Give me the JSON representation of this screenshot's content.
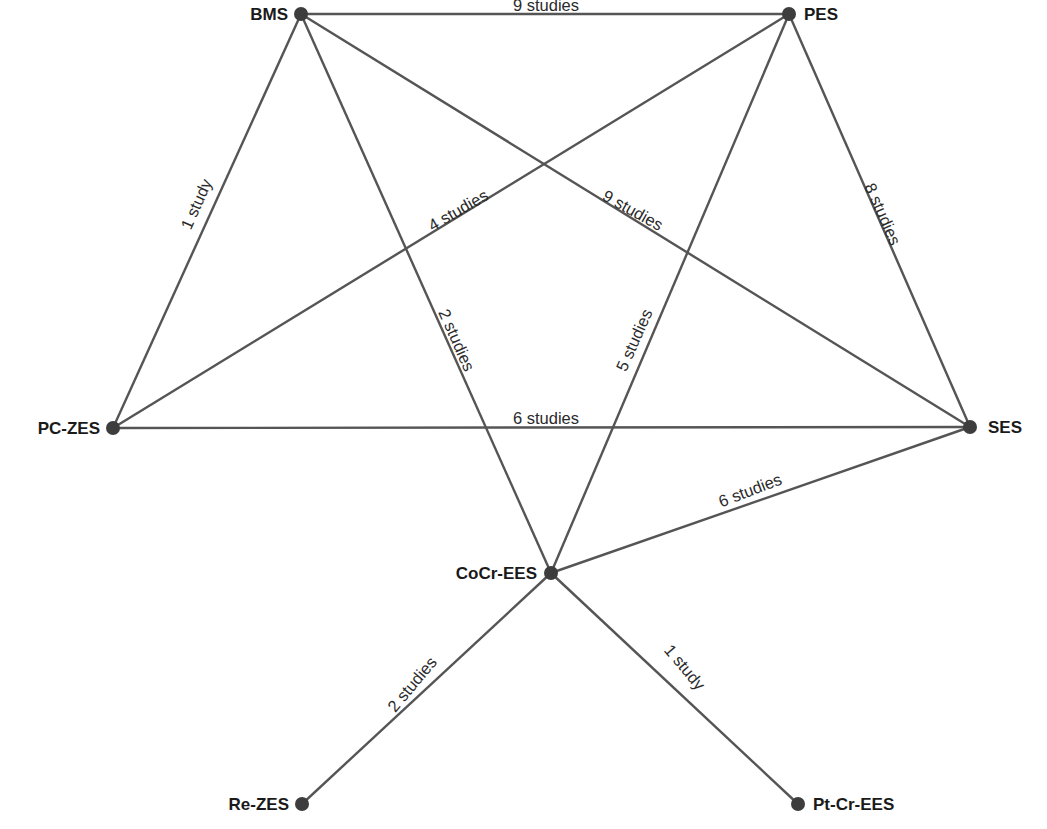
{
  "diagram": {
    "type": "network-meta-analysis",
    "nodes": [
      {
        "id": "BMS",
        "label": "BMS",
        "x": 301,
        "y": 14,
        "label_x": 288,
        "label_y": 20,
        "anchor": "end"
      },
      {
        "id": "PES",
        "label": "PES",
        "x": 789,
        "y": 14,
        "label_x": 804,
        "label_y": 20,
        "anchor": "start"
      },
      {
        "id": "PC-ZES",
        "label": "PC-ZES",
        "x": 113,
        "y": 428,
        "label_x": 100,
        "label_y": 434,
        "anchor": "end"
      },
      {
        "id": "SES",
        "label": "SES",
        "x": 970,
        "y": 427,
        "label_x": 988,
        "label_y": 433,
        "anchor": "start"
      },
      {
        "id": "CoCr-EES",
        "label": "CoCr-EES",
        "x": 551,
        "y": 573,
        "label_x": 537,
        "label_y": 579,
        "anchor": "end"
      },
      {
        "id": "Re-ZES",
        "label": "Re-ZES",
        "x": 302,
        "y": 804,
        "label_x": 289,
        "label_y": 810,
        "anchor": "end"
      },
      {
        "id": "Pt-Cr-EES",
        "label": "Pt-Cr-EES",
        "x": 798,
        "y": 804,
        "label_x": 813,
        "label_y": 810,
        "anchor": "start"
      }
    ],
    "edges": [
      {
        "from": "BMS",
        "to": "PES",
        "label": "9 studies",
        "lx": 546,
        "ly": 5,
        "angle": 0
      },
      {
        "from": "BMS",
        "to": "PC-ZES",
        "label": "1 study",
        "lx": 196,
        "ly": 204,
        "angle": -66
      },
      {
        "from": "BMS",
        "to": "CoCr-EES",
        "label": "2 studies",
        "lx": 457,
        "ly": 340,
        "angle": 66
      },
      {
        "from": "BMS",
        "to": "SES",
        "label": "9 studies",
        "lx": 633,
        "ly": 210,
        "angle": 29
      },
      {
        "from": "PES",
        "to": "PC-ZES",
        "label": "4 studies",
        "lx": 458,
        "ly": 210,
        "angle": -30
      },
      {
        "from": "PES",
        "to": "CoCr-EES",
        "label": "5 studies",
        "lx": 634,
        "ly": 340,
        "angle": -66
      },
      {
        "from": "PES",
        "to": "SES",
        "label": "8 studies",
        "lx": 883,
        "ly": 214,
        "angle": 66
      },
      {
        "from": "PC-ZES",
        "to": "SES",
        "label": "6 studies",
        "lx": 546,
        "ly": 418,
        "angle": 0
      },
      {
        "from": "CoCr-EES",
        "to": "SES",
        "label": "6 studies",
        "lx": 750,
        "ly": 490,
        "angle": -21
      },
      {
        "from": "CoCr-EES",
        "to": "Re-ZES",
        "label": "2 studies",
        "lx": 412,
        "ly": 684,
        "angle": -50
      },
      {
        "from": "CoCr-EES",
        "to": "Pt-Cr-EES",
        "label": "1 study",
        "lx": 685,
        "ly": 667,
        "angle": 50
      }
    ],
    "colors": {
      "edge": "#555555",
      "node": "#3d3d3d",
      "text": "#1a1a1a",
      "background": "#ffffff"
    }
  }
}
